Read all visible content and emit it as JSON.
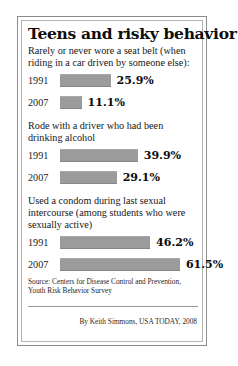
{
  "title": "Teens and risky behavior",
  "source": "Source: Centers for Disease Control and Prevention, Youth Risk Behavior Survey",
  "byline": "By Keith Simmons, USA TODAY, 2008",
  "bar_color": "#9b9b9b",
  "groups": [
    {
      "label": "Rarely or never wore a seat belt (when riding in a car driven by someone else):",
      "rows": [
        {
          "year": "1991",
          "value": 25.9,
          "value_label": "25.9%"
        },
        {
          "year": "2007",
          "value": 11.1,
          "value_label": "11.1%"
        }
      ]
    },
    {
      "label": "Rode with a driver who had been drinking alcohol",
      "rows": [
        {
          "year": "1991",
          "value": 39.9,
          "value_label": "39.9%"
        },
        {
          "year": "2007",
          "value": 29.1,
          "value_label": "29.1%"
        }
      ]
    },
    {
      "label": "Used a condom during last sexual intercourse (among students who were sexually active)",
      "rows": [
        {
          "year": "1991",
          "value": 46.2,
          "value_label": "46.2%"
        },
        {
          "year": "2007",
          "value": 61.5,
          "value_label": "61.5%"
        }
      ]
    }
  ],
  "chart_data": {
    "type": "bar",
    "title": "Teens and risky behavior",
    "xlabel": "",
    "ylabel": "",
    "xlim": [
      0,
      61.5
    ],
    "grid": false,
    "legend": "none",
    "orientation": "horizontal",
    "unit": "percent",
    "px_per_percent": 1.95,
    "categories": [
      "1991",
      "2007"
    ],
    "panels": [
      {
        "label": "Rarely or never wore a seat belt (when riding in a car driven by someone else):",
        "categories": [
          "1991",
          "2007"
        ],
        "values": [
          25.9,
          11.1
        ],
        "data_labels": [
          "25.9%",
          "11.1%"
        ]
      },
      {
        "label": "Rode with a driver who had been drinking alcohol",
        "categories": [
          "1991",
          "2007"
        ],
        "values": [
          39.9,
          29.1
        ],
        "data_labels": [
          "39.9%",
          "29.1%"
        ]
      },
      {
        "label": "Used a condom during last sexual intercourse (among students who were sexually active)",
        "categories": [
          "1991",
          "2007"
        ],
        "values": [
          46.2,
          61.5
        ],
        "data_labels": [
          "46.2%",
          "61.5%"
        ]
      }
    ],
    "annotations": [
      "Source: Centers for Disease Control and Prevention, Youth Risk Behavior Survey",
      "By Keith Simmons, USA TODAY, 2008"
    ]
  }
}
